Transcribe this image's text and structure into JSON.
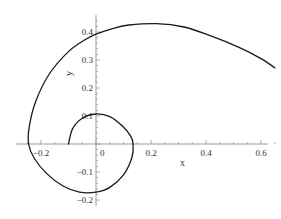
{
  "chart_data": {
    "type": "line",
    "title": "",
    "xlabel": "x",
    "ylabel": "y",
    "xlim": [
      -0.29,
      0.67
    ],
    "ylim": [
      -0.21,
      0.46
    ],
    "grid": false,
    "legend": null,
    "x_ticks": [
      -0.2,
      0,
      0.2,
      0.4,
      0.6
    ],
    "x_tick_labels": [
      "-0.2",
      "0",
      "0.2",
      "0.4",
      "0.6"
    ],
    "y_ticks": [
      -0.2,
      -0.1,
      0.1,
      0.2,
      0.3,
      0.4
    ],
    "y_tick_labels": [
      "-0.2",
      "-0.1",
      "0.1",
      "0.2",
      "0.3",
      "0.4"
    ],
    "series": [
      {
        "name": "spiral",
        "color": "#1a1a1a",
        "points": [
          [
            -0.1,
            0.0
          ],
          [
            -0.085,
            0.055
          ],
          [
            -0.05,
            0.092
          ],
          [
            0.0,
            0.107
          ],
          [
            0.05,
            0.098
          ],
          [
            0.095,
            0.065
          ],
          [
            0.125,
            0.03
          ],
          [
            0.135,
            0.0
          ],
          [
            0.13,
            -0.05
          ],
          [
            0.1,
            -0.11
          ],
          [
            0.05,
            -0.155
          ],
          [
            0.0,
            -0.172
          ],
          [
            -0.06,
            -0.172
          ],
          [
            -0.12,
            -0.15
          ],
          [
            -0.18,
            -0.105
          ],
          [
            -0.225,
            -0.05
          ],
          [
            -0.245,
            0.0
          ],
          [
            -0.243,
            0.06
          ],
          [
            -0.22,
            0.15
          ],
          [
            -0.17,
            0.25
          ],
          [
            -0.1,
            0.33
          ],
          [
            -0.04,
            0.372
          ],
          [
            0.0,
            0.392
          ],
          [
            0.06,
            0.412
          ],
          [
            0.12,
            0.425
          ],
          [
            0.22,
            0.43
          ],
          [
            0.32,
            0.418
          ],
          [
            0.42,
            0.385
          ],
          [
            0.52,
            0.345
          ],
          [
            0.6,
            0.305
          ],
          [
            0.65,
            0.272
          ]
        ]
      }
    ]
  },
  "axes": {
    "x_label": "x",
    "y_label": "y",
    "x_ticks": [
      {
        "value": -0.2,
        "label": "-0.2"
      },
      {
        "value": 0,
        "label": "0"
      },
      {
        "value": 0.2,
        "label": "0.2"
      },
      {
        "value": 0.4,
        "label": "0.4"
      },
      {
        "value": 0.6,
        "label": "0.6"
      }
    ],
    "y_ticks": [
      {
        "value": -0.2,
        "label": "-0.2"
      },
      {
        "value": -0.1,
        "label": "-0.1"
      },
      {
        "value": 0.1,
        "label": "0.1"
      },
      {
        "value": 0.2,
        "label": "0.2"
      },
      {
        "value": 0.3,
        "label": "0.3"
      },
      {
        "value": 0.4,
        "label": "0.4"
      }
    ]
  }
}
